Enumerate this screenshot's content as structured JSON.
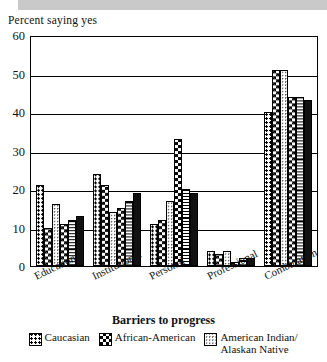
{
  "figure": {
    "ylabel": "Percent saying yes",
    "xlabel": "Barriers to progress"
  },
  "legend": {
    "items": [
      {
        "label": "Caucasian",
        "pattern": "p-dots"
      },
      {
        "label": "African-American",
        "pattern": "p-check"
      },
      {
        "label": "American Indian/ Alaskan Native",
        "pattern": "p-lightdots"
      }
    ]
  },
  "chart_data": {
    "type": "bar",
    "title": "",
    "xlabel": "Barriers to progress",
    "ylabel": "Percent saying yes",
    "ylim": [
      0,
      60
    ],
    "yticks": [
      0,
      10,
      20,
      30,
      40,
      50,
      60
    ],
    "grid": true,
    "legend_position": "bottom",
    "categories": [
      "Educational",
      "Institutional",
      "Personal",
      "Professional",
      "Combination"
    ],
    "series": [
      {
        "name": "Caucasian",
        "pattern": "p-dots",
        "values": [
          21,
          24,
          11,
          4,
          40
        ]
      },
      {
        "name": "African-American",
        "pattern": "p-check",
        "values": [
          10,
          21,
          12,
          3,
          51
        ]
      },
      {
        "name": "American Indian/ Alaskan Native",
        "pattern": "p-lightdots",
        "values": [
          16,
          14,
          17,
          4,
          51
        ]
      },
      {
        "name": "series-4",
        "pattern": "p-check",
        "values": [
          11,
          15,
          33,
          1,
          44
        ]
      },
      {
        "name": "series-5",
        "pattern": "p-hatch",
        "values": [
          12,
          17,
          20,
          2,
          44
        ]
      },
      {
        "name": "series-6",
        "pattern": "p-solid",
        "values": [
          13,
          19,
          19,
          2,
          43
        ]
      }
    ]
  }
}
